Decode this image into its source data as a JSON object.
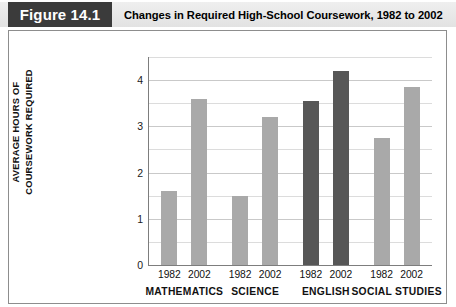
{
  "header": {
    "figure_tag": "Figure 14.1",
    "title": "Changes in Required High-School Coursework, 1982 to 2002"
  },
  "colors": {
    "figure_tag_bg": "#3b3b3b",
    "header_band_bg": "#e8e8e8",
    "bar_light": "#a9a9a9",
    "bar_dark": "#575757",
    "gridline": "#c9c9c9",
    "axis": "#7d7d7d",
    "frame_border": "#8d8d8d"
  },
  "chart_data": {
    "type": "bar",
    "title": "Changes in Required High-School Coursework, 1982 to 2002",
    "xlabel": "",
    "ylabel_lines": [
      "AVERAGE HOURS OF",
      "COURSEWORK REQUIRED"
    ],
    "ylabel": "AVERAGE HOURS OF COURSEWORK REQUIRED",
    "ylim": [
      0,
      4.5
    ],
    "ytick_labels": [
      "0",
      "1",
      "2",
      "3",
      "4"
    ],
    "ytick_values": [
      0,
      1,
      2,
      3,
      4
    ],
    "grid": true,
    "grid_minor_step": 0.5,
    "legend": "none",
    "categories": [
      "MATHEMATICS",
      "SCIENCE",
      "ENGLISH",
      "SOCIAL STUDIES"
    ],
    "series": [
      {
        "name": "1982",
        "values": [
          1.6,
          1.5,
          3.55,
          2.75
        ]
      },
      {
        "name": "2002",
        "values": [
          3.6,
          3.2,
          4.2,
          3.85
        ]
      }
    ],
    "groups": [
      {
        "category": "MATHEMATICS",
        "shade": "light",
        "bars": [
          {
            "year": "1982",
            "value": 1.6
          },
          {
            "year": "2002",
            "value": 3.6
          }
        ]
      },
      {
        "category": "SCIENCE",
        "shade": "light",
        "bars": [
          {
            "year": "1982",
            "value": 1.5
          },
          {
            "year": "2002",
            "value": 3.2
          }
        ]
      },
      {
        "category": "ENGLISH",
        "shade": "dark",
        "bars": [
          {
            "year": "1982",
            "value": 3.55
          },
          {
            "year": "2002",
            "value": 4.2
          }
        ]
      },
      {
        "category": "SOCIAL STUDIES",
        "shade": "light",
        "bars": [
          {
            "year": "1982",
            "value": 2.75
          },
          {
            "year": "2002",
            "value": 3.85
          }
        ]
      }
    ]
  }
}
